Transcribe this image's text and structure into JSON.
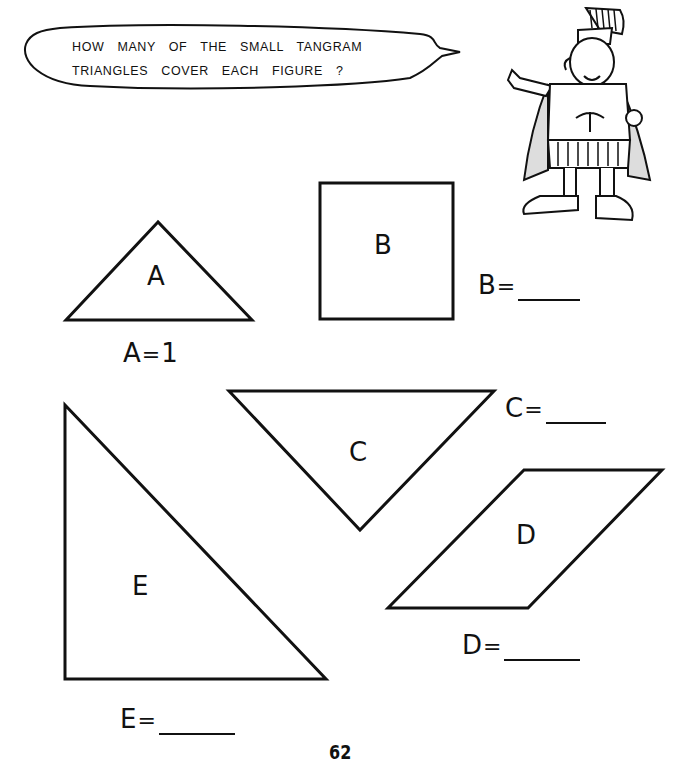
{
  "speech_bubble": {
    "line1": "HOW MANY OF THE SMALL TANGRAM",
    "line2": "TRIANGLES COVER EACH FIGURE ?"
  },
  "illustration": {
    "name": "roman-soldier-cartoon"
  },
  "figures": [
    {
      "id": "A",
      "label": "A",
      "shape": "triangle"
    },
    {
      "id": "B",
      "label": "B",
      "shape": "square"
    },
    {
      "id": "C",
      "label": "C",
      "shape": "triangle"
    },
    {
      "id": "D",
      "label": "D",
      "shape": "parallelogram"
    },
    {
      "id": "E",
      "label": "E",
      "shape": "triangle"
    }
  ],
  "answers": {
    "A": {
      "letter": "A",
      "eq": "=",
      "value": "1"
    },
    "B": {
      "letter": "B",
      "eq": "=",
      "value": ""
    },
    "C": {
      "letter": "C",
      "eq": "=",
      "value": ""
    },
    "D": {
      "letter": "D",
      "eq": "=",
      "value": ""
    },
    "E": {
      "letter": "E",
      "eq": "=",
      "value": ""
    }
  },
  "page_number": "62",
  "colors": {
    "ink": "#111111",
    "paper": "#ffffff"
  }
}
